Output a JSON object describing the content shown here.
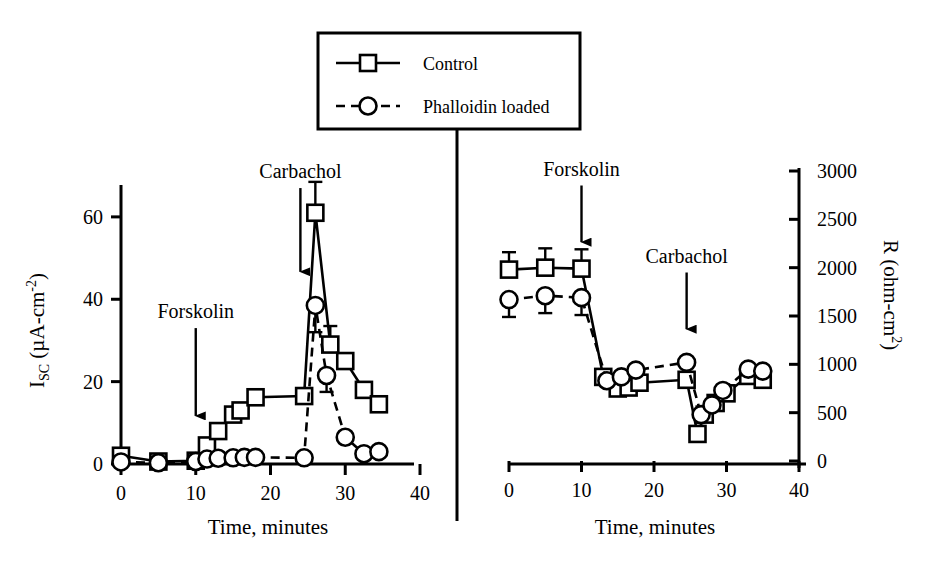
{
  "figure": {
    "background_color": "#ffffff",
    "ink_color": "#000000",
    "divider_label": "panel-divider"
  },
  "legend": {
    "position": "top-center",
    "border_color": "#000000",
    "entries": [
      {
        "label": "Control",
        "marker": "square-open",
        "line": "solid"
      },
      {
        "label": "Phalloidin loaded",
        "marker": "circle-open",
        "line": "dashed"
      }
    ]
  },
  "chart_data": [
    {
      "id": "left-panel",
      "type": "line",
      "title": "",
      "xlabel": "Time, minutes",
      "ylabel": "I_SC (µA-cm^-2)",
      "ylabel_parts": {
        "base": "I",
        "sub": "SC",
        "unit_open": " (µA-cm",
        "sup": "-2",
        "unit_close": ")"
      },
      "xlim": [
        0,
        40
      ],
      "ylim": [
        0,
        70
      ],
      "xticks": [
        0,
        10,
        20,
        30,
        40
      ],
      "yticks": [
        0,
        20,
        40,
        60
      ],
      "grid": false,
      "annotations": [
        {
          "text": "Forskolin",
          "arrow_x": 10,
          "arrow_y_from": 33,
          "arrow_y_to": 9
        },
        {
          "text": "Carbachol",
          "arrow_x": 24,
          "arrow_y_from": 67,
          "arrow_y_to": 44
        }
      ],
      "series": [
        {
          "name": "Control",
          "marker": "square-open",
          "line": "solid",
          "x": [
            0,
            5,
            10,
            11.5,
            13,
            15,
            16,
            18,
            24.5,
            26,
            28,
            30,
            32.5,
            34.5
          ],
          "y": [
            2.0,
            0.6,
            0.8,
            4.5,
            8.0,
            12.0,
            13.0,
            16.2,
            16.5,
            61.0,
            29.0,
            25.0,
            18.0,
            14.5
          ],
          "yerr": [
            1.8,
            0.0,
            1.3,
            0.0,
            0.0,
            1.5,
            0.0,
            1.8,
            1.5,
            7.5,
            4.5,
            0.0,
            1.5,
            0.0
          ]
        },
        {
          "name": "Phalloidin loaded",
          "marker": "circle-open",
          "line": "dashed",
          "x": [
            0,
            5,
            10,
            11.5,
            13,
            15,
            16.5,
            18,
            24.5,
            26,
            27.5,
            30,
            32.5,
            34.5
          ],
          "y": [
            0.5,
            0.3,
            0.6,
            1.2,
            1.4,
            1.5,
            1.6,
            1.6,
            1.5,
            38.5,
            21.5,
            6.5,
            2.5,
            3.0
          ],
          "yerr": [
            0.0,
            0.0,
            0.0,
            0.0,
            0.0,
            0.0,
            0.0,
            0.0,
            0.0,
            6.5,
            4.0,
            0.0,
            0.0,
            0.0
          ]
        }
      ]
    },
    {
      "id": "right-panel",
      "type": "line",
      "title": "",
      "xlabel": "Time, minutes",
      "ylabel": "R (ohm-cm2)",
      "ylabel_parts": {
        "base": "R (ohm-cm",
        "sup": "2",
        "close": ")"
      },
      "xlim": [
        0,
        40
      ],
      "ylim": [
        0,
        3000
      ],
      "xticks": [
        0,
        10,
        20,
        30,
        40
      ],
      "yticks": [
        0,
        500,
        1000,
        1500,
        2000,
        2500,
        3000
      ],
      "grid": false,
      "annotations": [
        {
          "text": "Forskolin",
          "arrow_x": 10,
          "arrow_y_from": 2850,
          "arrow_y_to": 2150
        },
        {
          "text": "Carbachol",
          "arrow_x": 24.5,
          "arrow_y_from": 1950,
          "arrow_y_to": 1250
        }
      ],
      "series": [
        {
          "name": "Control",
          "marker": "square-open",
          "line": "solid",
          "x": [
            0,
            5,
            10,
            13,
            15,
            16.5,
            18,
            24.5,
            26,
            27,
            28.5,
            30,
            33,
            35
          ],
          "y": [
            1980,
            2000,
            1990,
            870,
            750,
            760,
            810,
            840,
            280,
            480,
            600,
            700,
            880,
            840
          ],
          "yerr": [
            180,
            200,
            200,
            60,
            0,
            0,
            0,
            0,
            0,
            0,
            0,
            0,
            0,
            0
          ]
        },
        {
          "name": "Phalloidin loaded",
          "marker": "circle-open",
          "line": "dashed",
          "x": [
            0,
            5,
            10,
            13.5,
            15.5,
            17.5,
            24.5,
            26.5,
            28,
            29.5,
            33,
            35
          ],
          "y": [
            1670,
            1710,
            1690,
            830,
            870,
            940,
            1020,
            480,
            580,
            730,
            950,
            930
          ],
          "yerr": [
            180,
            180,
            180,
            0,
            0,
            0,
            0,
            0,
            0,
            0,
            0,
            0
          ]
        }
      ]
    }
  ]
}
